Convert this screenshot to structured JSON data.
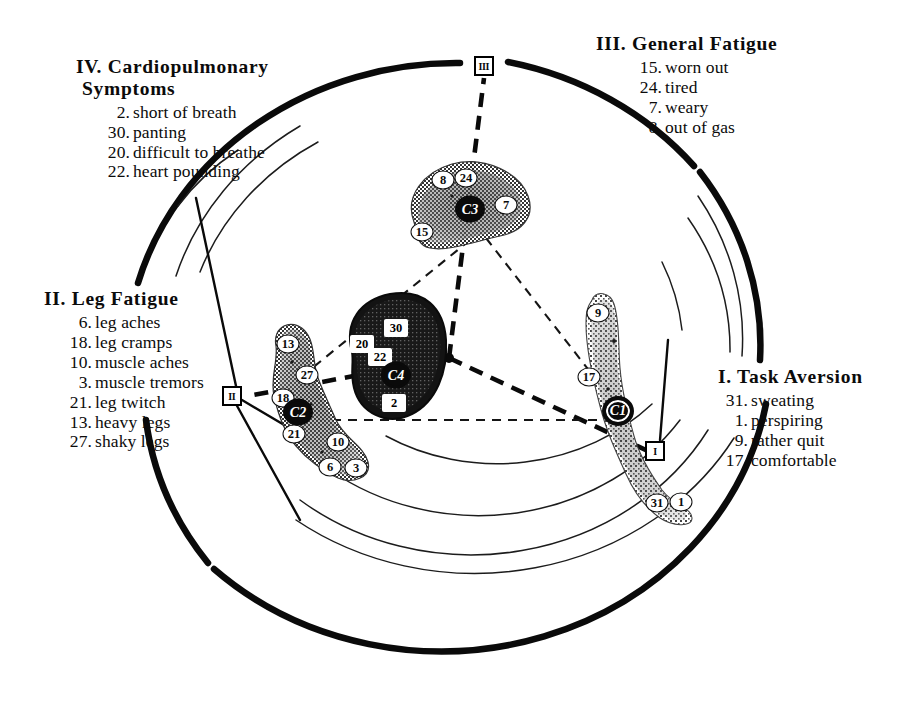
{
  "figure": {
    "background_color": "#ffffff",
    "ink_color": "#0b0b0b"
  },
  "quadrants": [
    {
      "id": "iv",
      "numeral": "IV.",
      "title": "IV. Cardiopulmonary\n      Symptoms",
      "items": [
        {
          "num": "2.",
          "label": "short of breath"
        },
        {
          "num": "30.",
          "label": "panting"
        },
        {
          "num": "20.",
          "label": "difficult to breathe"
        },
        {
          "num": "22.",
          "label": "heart pounding"
        }
      ]
    },
    {
      "id": "iii",
      "numeral": "III.",
      "title": "III. General  Fatigue",
      "items": [
        {
          "num": "15.",
          "label": "worn out"
        },
        {
          "num": "24.",
          "label": "tired"
        },
        {
          "num": "7.",
          "label": "weary"
        },
        {
          "num": "8.",
          "label": "out of gas"
        }
      ]
    },
    {
      "id": "ii",
      "numeral": "II.",
      "title": "II. Leg  Fatigue",
      "items": [
        {
          "num": "6.",
          "label": "leg aches"
        },
        {
          "num": "18.",
          "label": "leg cramps"
        },
        {
          "num": "10.",
          "label": "muscle aches"
        },
        {
          "num": "3.",
          "label": "muscle tremors"
        },
        {
          "num": "21.",
          "label": "leg twitch"
        },
        {
          "num": "13.",
          "label": "heavy legs"
        },
        {
          "num": "27.",
          "label": "shaky legs"
        }
      ]
    },
    {
      "id": "i",
      "numeral": "I.",
      "title": "I. Task Aversion",
      "items": [
        {
          "num": "31.",
          "label": "sweating"
        },
        {
          "num": "1.",
          "label": "perspiring"
        },
        {
          "num": "9.",
          "label": "rather quit"
        },
        {
          "num": "17.",
          "label": "comfortable"
        }
      ]
    }
  ],
  "axis_markers": [
    {
      "id": "marker-iii",
      "label": "III"
    },
    {
      "id": "marker-ii",
      "label": "II"
    },
    {
      "id": "marker-i",
      "label": "I"
    }
  ],
  "clusters": [
    {
      "id": "general-fatigue-cluster",
      "centroid_label": "C3",
      "points": [
        "8",
        "24",
        "7",
        "15"
      ]
    },
    {
      "id": "cardiopulmonary-cluster",
      "centroid_label": "C4",
      "points": [
        "30",
        "20",
        "22",
        "2"
      ]
    },
    {
      "id": "leg-fatigue-cluster",
      "centroid_label": "C2",
      "points": [
        "13",
        "27",
        "18",
        "21",
        "10",
        "6",
        "3"
      ]
    },
    {
      "id": "task-aversion-cluster",
      "centroid_label": "C1",
      "points": [
        "9",
        "17",
        "31",
        "1"
      ]
    }
  ],
  "plot_points": [
    {
      "id": "p8",
      "label": "8",
      "x": 443,
      "y": 180,
      "cluster": "general-fatigue-cluster",
      "style": "round"
    },
    {
      "id": "p24",
      "label": "24",
      "x": 466,
      "y": 178,
      "cluster": "general-fatigue-cluster",
      "style": "round"
    },
    {
      "id": "p7",
      "label": "7",
      "x": 506,
      "y": 205,
      "cluster": "general-fatigue-cluster",
      "style": "round"
    },
    {
      "id": "p15",
      "label": "15",
      "x": 422,
      "y": 232,
      "cluster": "general-fatigue-cluster",
      "style": "round"
    },
    {
      "id": "c3",
      "label": "C3",
      "x": 470,
      "y": 209,
      "cluster": "general-fatigue-cluster",
      "style": "centroid"
    },
    {
      "id": "p30",
      "label": "30",
      "x": 396,
      "y": 328,
      "cluster": "cardiopulmonary-cluster",
      "style": "square-on-dark"
    },
    {
      "id": "p20",
      "label": "20",
      "x": 362,
      "y": 344,
      "cluster": "cardiopulmonary-cluster",
      "style": "square-on-dark"
    },
    {
      "id": "p22",
      "label": "22",
      "x": 380,
      "y": 357,
      "cluster": "cardiopulmonary-cluster",
      "style": "square-on-dark"
    },
    {
      "id": "c4",
      "label": "C4",
      "x": 396,
      "y": 375,
      "cluster": "cardiopulmonary-cluster",
      "style": "centroid-on-dark"
    },
    {
      "id": "p2",
      "label": "2",
      "x": 394,
      "y": 403,
      "cluster": "cardiopulmonary-cluster",
      "style": "square-on-dark"
    },
    {
      "id": "p13",
      "label": "13",
      "x": 288,
      "y": 344,
      "cluster": "leg-fatigue-cluster",
      "style": "round"
    },
    {
      "id": "p27",
      "label": "27",
      "x": 307,
      "y": 375,
      "cluster": "leg-fatigue-cluster",
      "style": "round"
    },
    {
      "id": "p18",
      "label": "18",
      "x": 283,
      "y": 398,
      "cluster": "leg-fatigue-cluster",
      "style": "round"
    },
    {
      "id": "c2",
      "label": "C2",
      "x": 298,
      "y": 412,
      "cluster": "leg-fatigue-cluster",
      "style": "centroid"
    },
    {
      "id": "p21",
      "label": "21",
      "x": 294,
      "y": 434,
      "cluster": "leg-fatigue-cluster",
      "style": "round"
    },
    {
      "id": "p10",
      "label": "10",
      "x": 338,
      "y": 442,
      "cluster": "leg-fatigue-cluster",
      "style": "round"
    },
    {
      "id": "p6",
      "label": "6",
      "x": 330,
      "y": 467,
      "cluster": "leg-fatigue-cluster",
      "style": "round"
    },
    {
      "id": "p3",
      "label": "3",
      "x": 356,
      "y": 468,
      "cluster": "leg-fatigue-cluster",
      "style": "round"
    },
    {
      "id": "p9",
      "label": "9",
      "x": 598,
      "y": 313,
      "cluster": "task-aversion-cluster",
      "style": "round"
    },
    {
      "id": "p17",
      "label": "17",
      "x": 589,
      "y": 377,
      "cluster": "task-aversion-cluster",
      "style": "round"
    },
    {
      "id": "c1",
      "label": "C1",
      "x": 618,
      "y": 411,
      "cluster": "task-aversion-cluster",
      "style": "centroid-ring"
    },
    {
      "id": "p31",
      "label": "31",
      "x": 657,
      "y": 503,
      "cluster": "task-aversion-cluster",
      "style": "round"
    },
    {
      "id": "p1",
      "label": "1",
      "x": 681,
      "y": 502,
      "cluster": "task-aversion-cluster",
      "style": "round"
    }
  ]
}
